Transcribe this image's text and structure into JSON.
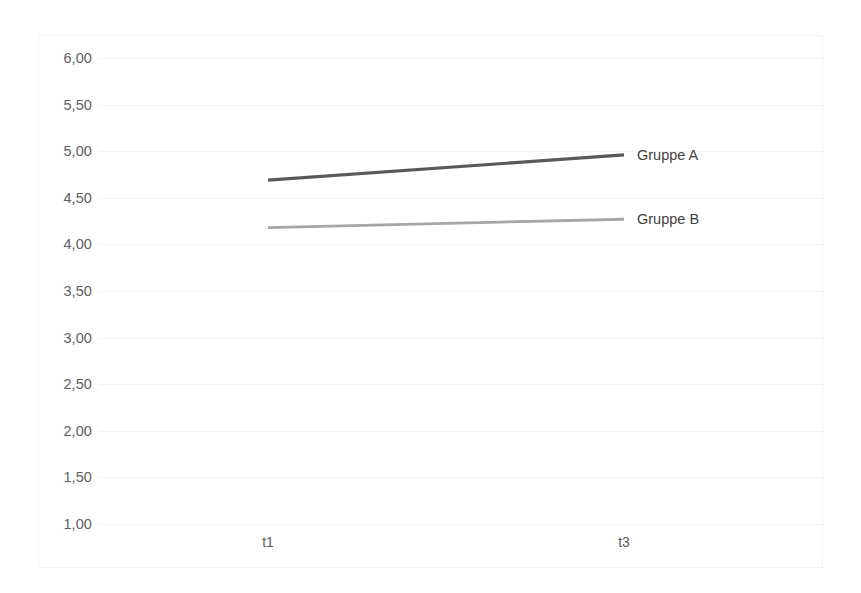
{
  "chart_data": {
    "type": "line",
    "title": "",
    "xlabel": "",
    "ylabel": "",
    "categories": [
      "t1",
      "t3"
    ],
    "x": [
      268,
      624
    ],
    "ylim": [
      1.0,
      6.0
    ],
    "ytick_step": 0.5,
    "ytick_labels": [
      "6,00",
      "5,50",
      "5,00",
      "4,50",
      "4,00",
      "3,50",
      "3,00",
      "2,50",
      "2,00",
      "1,50",
      "1,00"
    ],
    "ytick_values": [
      6.0,
      5.5,
      5.0,
      4.5,
      4.0,
      3.5,
      3.0,
      2.5,
      2.0,
      1.5,
      1.0
    ],
    "grid": true,
    "legend_position": "end-of-line",
    "decimal_separator": ",",
    "series": [
      {
        "name": "Gruppe A",
        "label": "Gruppe A",
        "color": "#595959",
        "values": [
          4.69,
          4.96
        ]
      },
      {
        "name": "Gruppe B",
        "label": "Gruppe B",
        "color": "#a6a6a6",
        "values": [
          4.18,
          4.27
        ]
      }
    ]
  },
  "colors": {
    "series_a": "#595959",
    "series_b": "#a6a6a6",
    "gridline": "#e4e6e8",
    "axis_text": "#60605f",
    "frame": "#f2f3f4",
    "background": "#ffffff"
  }
}
